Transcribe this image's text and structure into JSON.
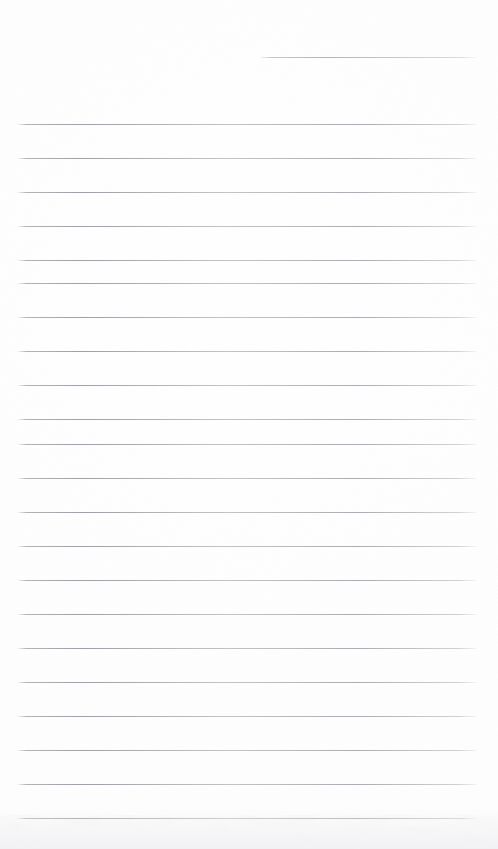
{
  "document": {
    "kind": "scanned-lined-notepad-page",
    "title": "Blank ruled notepad page (scan)",
    "page_width": 498,
    "page_height": 849,
    "background_color": "#fefefe",
    "rule_color": "#9fa1a8",
    "has_text_content": false,
    "has_margin_rule": false,
    "visible_text": ""
  },
  "ruling": {
    "line_count": 22,
    "line_spacing_px": 34,
    "first_full_line_y": 124,
    "left_margin_x": 17,
    "right_margin_x": 477,
    "line_thickness_px": 1,
    "lines": [
      {
        "id": "rule-partial-top",
        "y": 57,
        "x_start": 260,
        "x_end": 477,
        "partial": true
      },
      {
        "id": "rule-01",
        "y": 124,
        "x_start": 17,
        "x_end": 477,
        "partial": false
      },
      {
        "id": "rule-02",
        "y": 158,
        "x_start": 17,
        "x_end": 477,
        "partial": false
      },
      {
        "id": "rule-03",
        "y": 192,
        "x_start": 17,
        "x_end": 477,
        "partial": false
      },
      {
        "id": "rule-04",
        "y": 226,
        "x_start": 17,
        "x_end": 477,
        "partial": false
      },
      {
        "id": "rule-05",
        "y": 260,
        "x_start": 17,
        "x_end": 477,
        "partial": false
      },
      {
        "id": "rule-06",
        "y": 283,
        "x_start": 17,
        "x_end": 477,
        "partial": false
      },
      {
        "id": "rule-07",
        "y": 317,
        "x_start": 17,
        "x_end": 477,
        "partial": false
      },
      {
        "id": "rule-08",
        "y": 351,
        "x_start": 17,
        "x_end": 477,
        "partial": false
      },
      {
        "id": "rule-09",
        "y": 385,
        "x_start": 17,
        "x_end": 477,
        "partial": false
      },
      {
        "id": "rule-10",
        "y": 419,
        "x_start": 17,
        "x_end": 477,
        "partial": false
      },
      {
        "id": "rule-11",
        "y": 444,
        "x_start": 17,
        "x_end": 477,
        "partial": false
      },
      {
        "id": "rule-12",
        "y": 478,
        "x_start": 17,
        "x_end": 477,
        "partial": false
      },
      {
        "id": "rule-13",
        "y": 512,
        "x_start": 17,
        "x_end": 477,
        "partial": false
      },
      {
        "id": "rule-14",
        "y": 546,
        "x_start": 17,
        "x_end": 477,
        "partial": false
      },
      {
        "id": "rule-15",
        "y": 580,
        "x_start": 17,
        "x_end": 477,
        "partial": false
      },
      {
        "id": "rule-16",
        "y": 614,
        "x_start": 17,
        "x_end": 477,
        "partial": false
      },
      {
        "id": "rule-17",
        "y": 648,
        "x_start": 17,
        "x_end": 477,
        "partial": false
      },
      {
        "id": "rule-18",
        "y": 682,
        "x_start": 17,
        "x_end": 477,
        "partial": false
      },
      {
        "id": "rule-19",
        "y": 716,
        "x_start": 17,
        "x_end": 477,
        "partial": false
      },
      {
        "id": "rule-20",
        "y": 750,
        "x_start": 17,
        "x_end": 477,
        "partial": false
      },
      {
        "id": "rule-21",
        "y": 784,
        "x_start": 17,
        "x_end": 477,
        "partial": false
      },
      {
        "id": "rule-22",
        "y": 818,
        "x_start": 17,
        "x_end": 477,
        "partial": false
      }
    ]
  },
  "artifacts": {
    "bottom_scan_shadow": true,
    "paper_grain": true
  }
}
